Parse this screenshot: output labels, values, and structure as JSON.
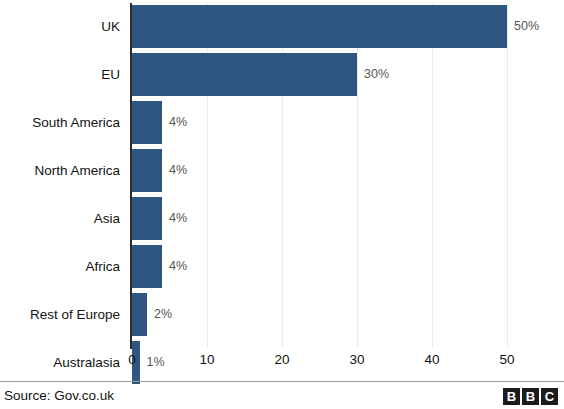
{
  "chart_data": {
    "type": "bar",
    "orientation": "horizontal",
    "title": "",
    "subtitle": "",
    "xlabel": "",
    "ylabel": "",
    "categories": [
      "UK",
      "EU",
      "South America",
      "North America",
      "Asia",
      "Africa",
      "Rest of Europe",
      "Australasia"
    ],
    "values": [
      50,
      30,
      4,
      4,
      4,
      4,
      2,
      1
    ],
    "data_labels": [
      "50%",
      "30%",
      "4%",
      "4%",
      "4%",
      "4%",
      "2%",
      "1%"
    ],
    "xlim": [
      0,
      55
    ],
    "xticks": [
      0,
      10,
      20,
      30,
      40,
      50
    ],
    "xtick_labels": [
      "0",
      "10",
      "20",
      "30",
      "40",
      "50"
    ],
    "grid": true,
    "grid_axis": "x",
    "legend": false,
    "series": [
      {
        "name": "Share",
        "color": "#2f5680",
        "values": [
          50,
          30,
          4,
          4,
          4,
          4,
          2,
          1
        ]
      }
    ],
    "colors": {
      "bar": "#2f5680",
      "background": "#ffffff",
      "axis": "#2d2d2d",
      "gridline": "#e9ecef",
      "category_label": "#131313",
      "value_label": "#565656",
      "divider": "#9a9a9a",
      "logo": "#1c1c1c"
    }
  },
  "footer": {
    "source": "Source: Gov.co.uk",
    "logo_letters": [
      "B",
      "B",
      "C"
    ]
  }
}
